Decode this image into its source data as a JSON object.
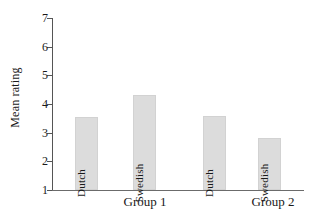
{
  "chart_data": {
    "type": "bar",
    "title": "",
    "xlabel": "",
    "ylabel": "Mean rating",
    "ylim": [
      1,
      7
    ],
    "yticks": [
      1,
      2,
      3,
      4,
      5,
      6,
      7
    ],
    "ytick_labels": [
      "1",
      "2",
      "3",
      "4",
      "5",
      "6",
      "7"
    ],
    "grid": false,
    "legend": "none",
    "categories": [
      "Group 1",
      "Group 2"
    ],
    "bar_labels": [
      "Dutch",
      "Swedish",
      "Dutch",
      "Swedish"
    ],
    "bars": [
      {
        "group": "Group 1",
        "label": "Dutch",
        "value": 3.55
      },
      {
        "group": "Group 1",
        "label": "Swedish",
        "value": 4.31
      },
      {
        "group": "Group 2",
        "label": "Dutch",
        "value": 3.58
      },
      {
        "group": "Group 2",
        "label": "Swedish",
        "value": 2.83
      }
    ],
    "series": [
      {
        "name": "Dutch",
        "values": [
          3.55,
          3.58
        ]
      },
      {
        "name": "Swedish",
        "values": [
          4.31,
          2.83
        ]
      }
    ],
    "colors": {
      "bar_fill": "#dcdcdc",
      "bar_stroke": "#d2d2d2",
      "axis": "#555555",
      "text": "#1a1a1a",
      "background": "#ffffff"
    }
  }
}
